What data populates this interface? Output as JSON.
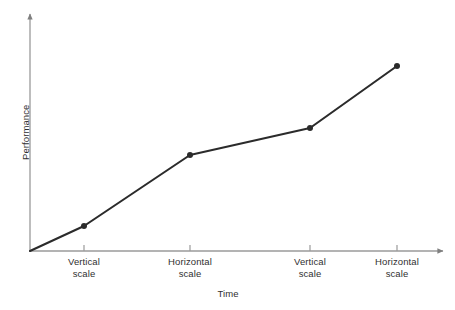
{
  "chart_data": {
    "type": "line",
    "title": "",
    "subtitle": "",
    "xlabel": "Time",
    "ylabel": "Performance",
    "grid": false,
    "legend": false,
    "legend_position": "none",
    "axis_style": "arrow-axes",
    "xlim": [
      0,
      1
    ],
    "ylim": [
      0,
      1
    ],
    "x_tick_labels": [
      "Vertical scale",
      "Horizontal scale",
      "Vertical scale",
      "Horizontal scale"
    ],
    "y_tick_labels": [],
    "annotations": [],
    "series": [
      {
        "name": "Performance over time",
        "marker": "circle",
        "color": "#2b2b2b",
        "points": [
          {
            "label": "origin",
            "x": 0.0,
            "y": 0.0,
            "marker": false
          },
          {
            "label": "Vertical scale",
            "x": 0.129,
            "y": 0.104,
            "marker": true
          },
          {
            "label": "Horizontal scale",
            "x": 0.383,
            "y": 0.398,
            "marker": true
          },
          {
            "label": "Vertical scale",
            "x": 0.67,
            "y": 0.51,
            "marker": true
          },
          {
            "label": "Horizontal scale",
            "x": 0.878,
            "y": 0.768,
            "marker": true
          }
        ]
      }
    ]
  },
  "geometry": {
    "origin_x": 30,
    "origin_y": 251,
    "x_axis_end": 448,
    "y_axis_top": 10,
    "pixel_points": [
      {
        "x": 30,
        "y": 251
      },
      {
        "x": 84,
        "y": 226
      },
      {
        "x": 190,
        "y": 155
      },
      {
        "x": 310,
        "y": 128
      },
      {
        "x": 397,
        "y": 66
      }
    ],
    "tick_x": [
      84,
      190,
      310,
      397
    ]
  },
  "colors": {
    "background": "#ffffff",
    "axis": "#9a9a9a",
    "data_line": "#2b2b2b",
    "marker": "#2b2b2b",
    "text": "#2f2f2f"
  },
  "labels": {
    "y_axis_title": "Performance",
    "x_axis_title": "Time",
    "ticks": [
      {
        "line1": "Vertical",
        "line2": "scale"
      },
      {
        "line1": "Horizontal",
        "line2": "scale"
      },
      {
        "line1": "Vertical",
        "line2": "scale"
      },
      {
        "line1": "Horizontal",
        "line2": "scale"
      }
    ]
  }
}
